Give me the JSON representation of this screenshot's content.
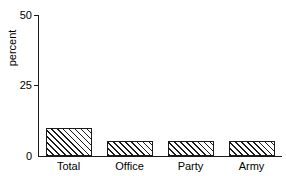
{
  "chart_data": {
    "type": "bar",
    "title": "",
    "xlabel": "",
    "ylabel": "percent",
    "categories": [
      "Total",
      "Office",
      "Party",
      "Army"
    ],
    "values": [
      9.8,
      5.2,
      5.2,
      5.2
    ],
    "ylim": [
      0,
      50
    ],
    "yticks": [
      0,
      25,
      50
    ],
    "ytick_labels": [
      "0",
      "25",
      "50"
    ],
    "grid": false,
    "legend": null,
    "bar_fill": "diagonal-hatch",
    "bar_edge_color": "#1a1a1a",
    "background_color": "#ffffff"
  },
  "axes": {
    "y_label": "percent",
    "y_ticks": [
      {
        "label": "50",
        "value": 50
      },
      {
        "label": "25",
        "value": 25
      },
      {
        "label": "0",
        "value": 0
      }
    ],
    "x_ticks": [
      {
        "label": "Total"
      },
      {
        "label": "Office"
      },
      {
        "label": "Party"
      },
      {
        "label": "Army"
      }
    ]
  }
}
